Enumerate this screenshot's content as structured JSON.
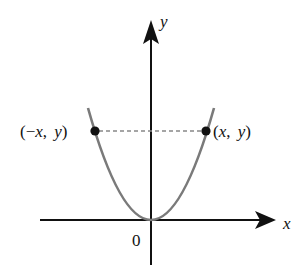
{
  "diagram": {
    "title": "",
    "type": "even function symmetry about y-axis (parabola)",
    "axes": {
      "x_label": "x",
      "y_label": "y",
      "origin_label": "0"
    },
    "curve": {
      "description": "parabola y = x^2 with vertex at origin",
      "color": "#7a7a7a"
    },
    "points": [
      {
        "id": "left",
        "label_open": "(",
        "label_minus": "−",
        "label_x": "x",
        "label_sep": ", ",
        "label_y": "y",
        "label_close": ")"
      },
      {
        "id": "right",
        "label_open": "(",
        "label_x": "x",
        "label_sep": ", ",
        "label_y": "y",
        "label_close": ")"
      }
    ],
    "connector": {
      "style": "dashed",
      "color": "#888888"
    },
    "colors": {
      "axis": "#111111",
      "curve": "#7a7a7a",
      "point": "#111111",
      "dashed": "#888888"
    }
  }
}
